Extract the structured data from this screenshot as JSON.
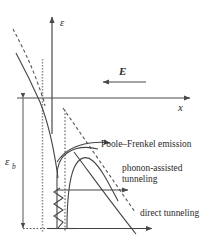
{
  "figure": {
    "kind": "energy-band-diagram",
    "background_color": "#ffffff",
    "line_color": "#444444",
    "axes": {
      "vertical_label": "ε",
      "horizontal_label": "x"
    },
    "field_arrow": {
      "label": "E",
      "direction": "left"
    },
    "barrier_height_label": {
      "symbol": "ε",
      "subscript": "b"
    },
    "mechanisms": [
      {
        "id": "poole-frenkel",
        "label": "Poole–Frenkel emission"
      },
      {
        "id": "phonon-assisted",
        "label_line1": "phonon-assisted",
        "label_line2": "tunneling"
      },
      {
        "id": "direct",
        "label": "direct tunneling"
      }
    ]
  }
}
